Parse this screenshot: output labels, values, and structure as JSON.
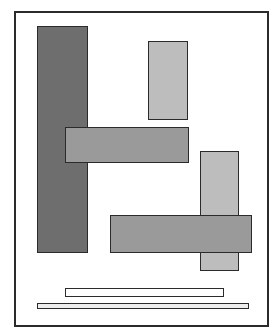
{
  "canvas": {
    "width": 278,
    "height": 336,
    "background": "#ffffff"
  },
  "shapes": [
    {
      "id": "frame",
      "name": "outer-frame",
      "x": 14,
      "y": 11,
      "w": 255,
      "h": 316,
      "fill": "#ffffff",
      "border": "#2b2b2b"
    },
    {
      "id": "dark-vertical",
      "name": "dark-vertical-rect",
      "x": 37,
      "y": 26,
      "w": 51,
      "h": 227,
      "fill": "#6e6e6e",
      "border": "#2b2b2b"
    },
    {
      "id": "light-vertical-top",
      "name": "light-vertical-rect-top",
      "x": 148,
      "y": 41,
      "w": 40,
      "h": 79,
      "fill": "#bdbdbd",
      "border": "#2b2b2b"
    },
    {
      "id": "light-vertical-right",
      "name": "light-vertical-rect-right",
      "x": 200,
      "y": 151,
      "w": 39,
      "h": 120,
      "fill": "#bdbdbd",
      "border": "#2b2b2b"
    },
    {
      "id": "mid-horizontal-top",
      "name": "medium-horizontal-rect-top",
      "x": 65,
      "y": 127,
      "w": 124,
      "h": 36,
      "fill": "#9a9a9a",
      "border": "#2b2b2b"
    },
    {
      "id": "mid-horizontal-bottom",
      "name": "medium-horizontal-rect-bottom",
      "x": 110,
      "y": 215,
      "w": 142,
      "h": 38,
      "fill": "#9a9a9a",
      "border": "#2b2b2b"
    },
    {
      "id": "bar-upper",
      "name": "thin-bar-upper",
      "x": 65,
      "y": 288,
      "w": 159,
      "h": 9,
      "fill": "#ffffff",
      "border": "#2b2b2b"
    },
    {
      "id": "bar-lower",
      "name": "thin-bar-lower",
      "x": 37,
      "y": 303,
      "w": 212,
      "h": 6,
      "fill": "#eeeeee",
      "border": "#2b2b2b"
    }
  ]
}
